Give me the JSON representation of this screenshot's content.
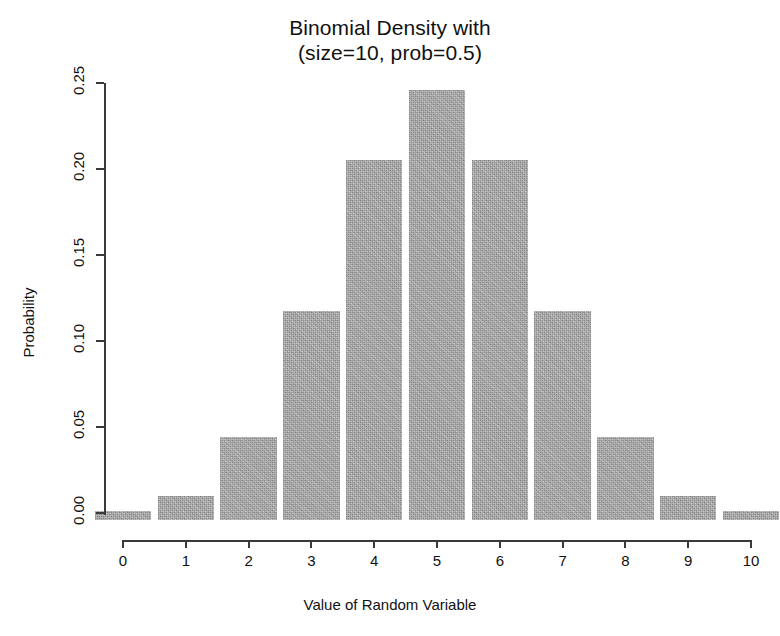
{
  "chart_data": {
    "type": "bar",
    "title": "Binomial Density with\n(size=10, prob=0.5)",
    "title_lines": [
      "Binomial Density with",
      "(size=10, prob=0.5)"
    ],
    "xlabel": "Value of Random Variable",
    "ylabel": "Probability",
    "categories": [
      "0",
      "1",
      "2",
      "3",
      "4",
      "5",
      "6",
      "7",
      "8",
      "9",
      "10"
    ],
    "x": [
      0,
      1,
      2,
      3,
      4,
      5,
      6,
      7,
      8,
      9,
      10
    ],
    "values": [
      0.001,
      0.0098,
      0.0439,
      0.1172,
      0.2051,
      0.2461,
      0.2051,
      0.1172,
      0.0439,
      0.0098,
      0.001
    ],
    "xlim": [
      -0.3,
      10.3
    ],
    "ylim": [
      0.0,
      0.25
    ],
    "xticks": [
      0,
      1,
      2,
      3,
      4,
      5,
      6,
      7,
      8,
      9,
      10
    ],
    "xtick_labels": [
      "0",
      "1",
      "2",
      "3",
      "4",
      "5",
      "6",
      "7",
      "8",
      "9",
      "10"
    ],
    "yticks": [
      0.0,
      0.05,
      0.1,
      0.15,
      0.2,
      0.25
    ],
    "ytick_labels": [
      "0.00",
      "0.05",
      "0.10",
      "0.15",
      "0.20",
      "0.25"
    ],
    "grid": false,
    "legend": null,
    "bar_color": "#a9a9a9",
    "axis_color": "#3a3a3a",
    "text_color": "#111111",
    "background": "#ffffff",
    "bar_width": 0.9,
    "ytick_label_rotation": 90,
    "ylabel_rotation": 90
  }
}
